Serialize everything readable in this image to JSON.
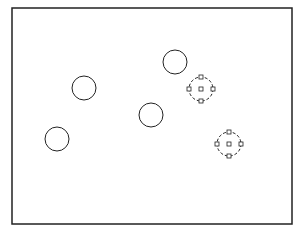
{
  "drawing": {
    "frame": {
      "x": 12,
      "y": 8,
      "width": 280,
      "height": 216,
      "stroke": "#222222"
    },
    "circles": [
      {
        "id": "circle-1",
        "cx": 175,
        "cy": 62,
        "r": 12,
        "selected": false
      },
      {
        "id": "circle-2",
        "cx": 84,
        "cy": 88,
        "r": 12,
        "selected": false
      },
      {
        "id": "circle-3",
        "cx": 151,
        "cy": 115,
        "r": 12,
        "selected": false
      },
      {
        "id": "circle-4",
        "cx": 57,
        "cy": 139,
        "r": 12,
        "selected": false
      },
      {
        "id": "circle-5",
        "cx": 201,
        "cy": 89,
        "r": 12,
        "selected": true
      },
      {
        "id": "circle-6",
        "cx": 229,
        "cy": 144,
        "r": 12,
        "selected": true
      }
    ],
    "grip_size": 4
  },
  "caption": ""
}
